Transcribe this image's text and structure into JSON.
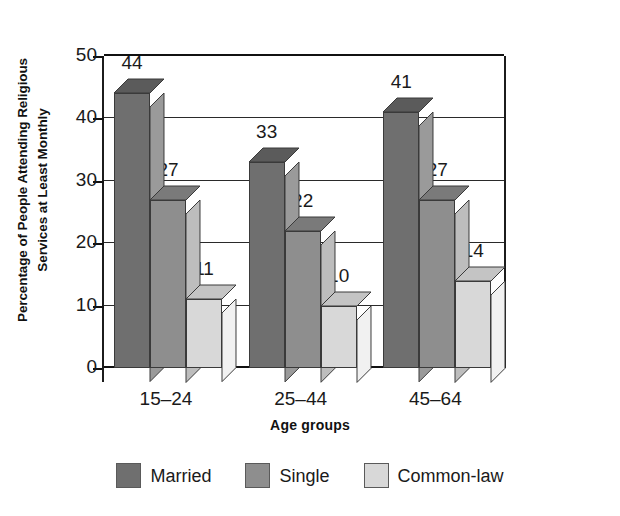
{
  "chart_data": {
    "type": "bar",
    "title": "",
    "subtitle": "",
    "xlabel": "Age groups",
    "ylabel": "Percentage of People Attending Religious Services at Least Monthly",
    "ylabel_lines": [
      "Percentage of People Attending Religious",
      "Services at Least Monthly"
    ],
    "categories": [
      "15–24",
      "25–44",
      "45–64"
    ],
    "series": [
      {
        "name": "Married",
        "values": [
          44,
          33,
          41
        ],
        "color": "#6f6f6f"
      },
      {
        "name": "Single",
        "values": [
          27,
          22,
          27
        ],
        "color": "#8e8e8e"
      },
      {
        "name": "Common-law",
        "values": [
          11,
          10,
          14
        ],
        "color": "#d8d8d8"
      }
    ],
    "ylim": [
      0,
      50
    ],
    "ytick_step": 10,
    "yticks": [
      0,
      10,
      20,
      30,
      40,
      50
    ],
    "ytick_labels": [
      "0",
      "10",
      "20",
      "30",
      "40",
      "50"
    ],
    "grid": true,
    "grid_axis": "y",
    "legend_position": "bottom",
    "data_labels": true,
    "style": "3d-columns",
    "depth_px": 14
  },
  "axes": {
    "y": {
      "ticks": [
        {
          "value": 50,
          "label": "50"
        },
        {
          "value": 40,
          "label": "40"
        },
        {
          "value": 30,
          "label": "30"
        },
        {
          "value": 20,
          "label": "20"
        },
        {
          "value": 10,
          "label": "10"
        },
        {
          "value": 0,
          "label": "0"
        }
      ]
    },
    "x": {
      "title": "Age groups",
      "categories": [
        "15–24",
        "25–44",
        "45–64"
      ]
    }
  },
  "legend": {
    "items": [
      {
        "label": "Married",
        "color": "#6f6f6f"
      },
      {
        "label": "Single",
        "color": "#8e8e8e"
      },
      {
        "label": "Common-law",
        "color": "#d8d8d8"
      }
    ]
  },
  "colors": {
    "married_front": "#6f6f6f",
    "married_top": "#5b5b5b",
    "married_side": "#9a9a9a",
    "single_front": "#8e8e8e",
    "single_top": "#7a7a7a",
    "single_side": "#bdbdbd",
    "commonlaw_front": "#d8d8d8",
    "commonlaw_top": "#c4c4c4",
    "commonlaw_side": "#f1f1f1",
    "axis": "#111111",
    "grid": "#2a2a2a",
    "text": "#1a1a1a",
    "background": "#ffffff"
  }
}
